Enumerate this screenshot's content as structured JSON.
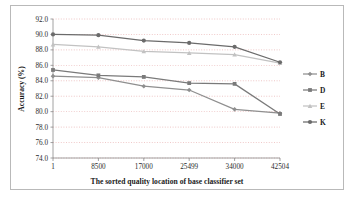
{
  "figure": {
    "border_color": "#b9b9b9",
    "background": "#ffffff"
  },
  "chart_data": {
    "type": "line",
    "title": "",
    "xlabel": "The sorted quality location of base classifier set",
    "ylabel": "Accuracy (%)",
    "categories": [
      "1",
      "8500",
      "17000",
      "25499",
      "34000",
      "42504"
    ],
    "x_tick_labels": [
      "1",
      "8500",
      "17000",
      "25499",
      "34000",
      "42504"
    ],
    "y_tick_labels": [
      "74.0",
      "76.0",
      "78.0",
      "80.0",
      "82.0",
      "84.0",
      "86.0",
      "88.0",
      "90.0",
      "92.0"
    ],
    "ylim": [
      74.0,
      92.0
    ],
    "y_tick_step": 2.0,
    "grid": true,
    "grid_style": "dotted-horizontal",
    "grid_color": "#d46a6a",
    "legend_position": "right",
    "series": [
      {
        "name": "B",
        "color": "#8f8f8f",
        "marker": "diamond",
        "values": [
          84.6,
          84.4,
          83.3,
          82.8,
          80.3,
          79.8
        ]
      },
      {
        "name": "D",
        "color": "#7a7a7a",
        "marker": "square",
        "values": [
          85.4,
          84.7,
          84.5,
          83.7,
          83.6,
          79.7
        ]
      },
      {
        "name": "E",
        "color": "#c2c2c2",
        "marker": "triangle",
        "values": [
          88.7,
          88.4,
          87.8,
          87.6,
          87.4,
          86.3
        ]
      },
      {
        "name": "K",
        "color": "#6b6b6b",
        "marker": "circle",
        "values": [
          90.0,
          89.9,
          89.2,
          88.9,
          88.4,
          86.4
        ]
      }
    ]
  },
  "legend": {
    "items": [
      {
        "label": "B"
      },
      {
        "label": "D"
      },
      {
        "label": "E"
      },
      {
        "label": "K"
      }
    ]
  }
}
